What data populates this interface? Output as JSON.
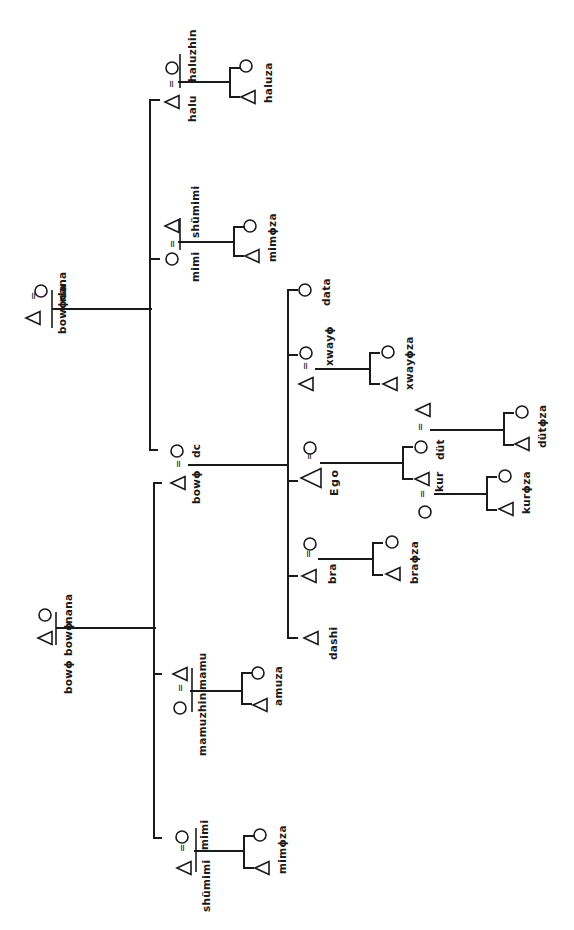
{
  "diagram": {
    "type": "kinship-chart",
    "orientation": "rotated-90",
    "legend": {
      "triangle": "male",
      "circle": "female",
      "equals": "marriage"
    },
    "colors": {
      "ink": "#1a1a1a",
      "paper": "#ffffff"
    },
    "generations": {
      "g1": {
        "paternal_grandparents": {
          "husband": "bowϕda",
          "wife": "nana"
        },
        "maternal_grandparents": {
          "husband": "bowϕ bowϕ",
          "wife": "nana"
        }
      },
      "g2": {
        "father_side": [
          {
            "name": "halu",
            "sex": "male",
            "spouse": "haluzhin",
            "spouse_sex": "female",
            "children_label": "haluza"
          },
          {
            "name": "mimi",
            "sex": "female",
            "spouse": "shümimi",
            "spouse_sex": "male",
            "children_label": "mimϕza"
          }
        ],
        "parents": {
          "father": "bowϕ",
          "mother": "dc"
        },
        "mother_side": [
          {
            "name": "mamu",
            "sex": "male",
            "spouse": "mamuzhin",
            "spouse_sex": "female",
            "children_label": "amuza"
          },
          {
            "name": "mimi",
            "sex": "female",
            "spouse": "shümimi",
            "spouse_sex": "male",
            "children_label": "mimϕza"
          }
        ]
      },
      "g3": {
        "siblings": [
          {
            "name": "data",
            "sex": "female"
          },
          {
            "name": "xwayϕ",
            "sex": "female",
            "spouse_sex": "male",
            "children_label": "xwayϕza"
          },
          {
            "name": "Ego",
            "sex": "male",
            "spouse_sex": "female"
          },
          {
            "name": "bra",
            "sex": "male",
            "spouse_sex": "female",
            "children_label": "braϕza"
          },
          {
            "name": "dashi",
            "sex": "male"
          }
        ]
      },
      "g4": {
        "ego_children": [
          {
            "name": "düt",
            "sex": "female",
            "spouse_sex": "male",
            "children_label": "dütϕza"
          },
          {
            "name": "kur",
            "sex": "male",
            "spouse_sex": "female",
            "children_label": "kurϕza"
          }
        ]
      }
    },
    "labels": {
      "pgf": "bowϕda",
      "pgm": "nana",
      "mgf": "bowϕ bowϕ",
      "mgm": "nana",
      "halu": "halu",
      "haluzhin": "haluzhin",
      "haluza": "haluza",
      "fz": "mimi",
      "fzh": "shümimi",
      "fzc": "mimϕza",
      "father": "bowϕ",
      "mother": "dc",
      "mb": "mamu",
      "mbw": "mamuzhin",
      "mbc": "amuza",
      "mz": "mimi",
      "mzh": "shümimi",
      "mzc": "mimϕza",
      "data": "data",
      "xway": "xwayϕ",
      "xwayza": "xwayϕza",
      "ego": "Ego",
      "dut": "düt",
      "dutza": "dütϕza",
      "kur": "kur",
      "kurza": "kurϕza",
      "bra": "bra",
      "braza": "braϕza",
      "dashi": "dashi",
      "equals": "="
    }
  }
}
